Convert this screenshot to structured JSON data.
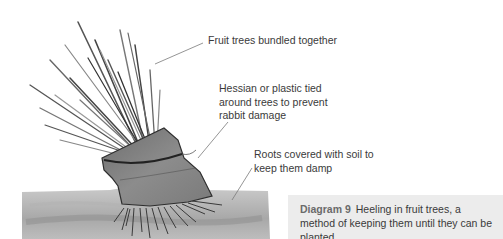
{
  "diagram": {
    "labels": [
      {
        "id": "trees",
        "lines": [
          "Fruit trees bundled together"
        ]
      },
      {
        "id": "hessian",
        "lines": [
          "Hessian or plastic tied",
          "around trees to prevent",
          "rabbit damage"
        ]
      },
      {
        "id": "roots",
        "lines": [
          "Roots covered with soil to",
          "keep them damp"
        ]
      }
    ]
  },
  "caption": {
    "title": "Diagram 9",
    "text": "Heeling in fruit trees, a method of keeping them until they can be planted."
  },
  "colors": {
    "caption_bg": "#ececec",
    "label_text": "#3a3a3a",
    "caption_title": "#6a6a6a"
  }
}
